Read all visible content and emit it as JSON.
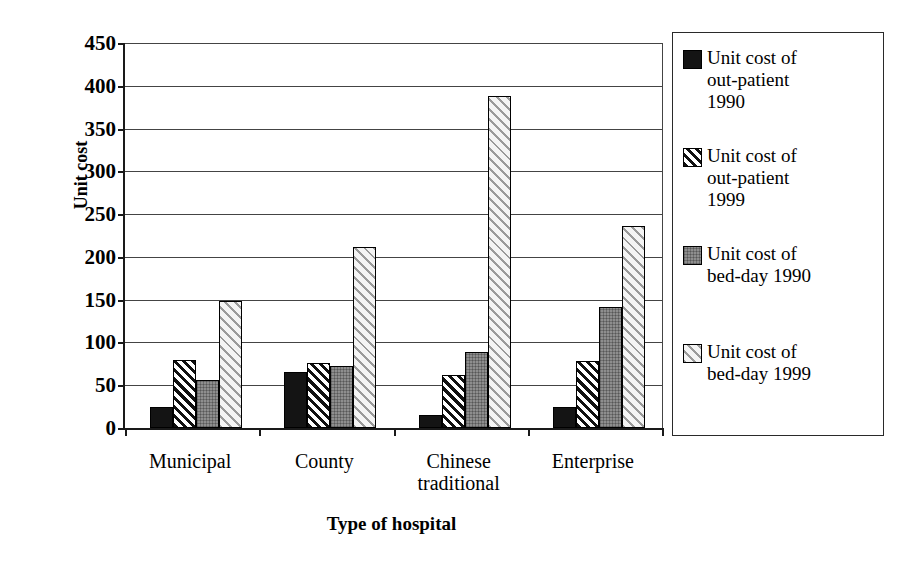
{
  "chart_data": {
    "type": "bar",
    "title": "",
    "subtitle": "",
    "xlabel": "Type of hospital",
    "ylabel": "Unit cost",
    "categories": [
      "Municipal",
      "County",
      "Chinese traditional",
      "Enterprise"
    ],
    "category_lines": [
      [
        "Municipal"
      ],
      [
        "County"
      ],
      [
        "Chinese",
        "traditional"
      ],
      [
        "Enterprise"
      ]
    ],
    "series": [
      {
        "name": "Unit cost of out-patient 1990",
        "name_lines": [
          "Unit cost of",
          "out-patient",
          "1990"
        ],
        "pattern": "solid-black",
        "values": [
          25,
          65,
          15,
          25
        ]
      },
      {
        "name": "Unit cost of out-patient 1999",
        "name_lines": [
          "Unit cost of",
          "out-patient",
          "1999"
        ],
        "pattern": "dark-hatch",
        "values": [
          80,
          76,
          62,
          78
        ]
      },
      {
        "name": "Unit cost of bed-day 1990",
        "name_lines": [
          "Unit cost of",
          "bed-day 1990"
        ],
        "pattern": "gray-dots",
        "values": [
          56,
          72,
          89,
          141
        ]
      },
      {
        "name": "Unit cost of bed-day 1999",
        "name_lines": [
          "Unit cost of",
          "bed-day 1999"
        ],
        "pattern": "light-hatch",
        "values": [
          148,
          212,
          388,
          236
        ]
      }
    ],
    "ylim": [
      0,
      450
    ],
    "ytick_step": 50,
    "ytick_labels": [
      "450",
      "400",
      "350",
      "300",
      "250",
      "200",
      "150",
      "100",
      "50",
      "0"
    ],
    "ytick_values": [
      450,
      400,
      350,
      300,
      250,
      200,
      150,
      100,
      50,
      0
    ],
    "grid": true,
    "grid_axis": "y",
    "legend_position": "right"
  },
  "axis": {
    "y_title": "Unit cost",
    "x_title": "Type of hospital"
  },
  "colors": {
    "axis": "#1a1a1a",
    "gridline": "#444444",
    "bar_outline": "#000000",
    "series_1": "#141414",
    "series_2": "#111111",
    "series_3": "#8e8e8e",
    "series_4": "#9a9a9a",
    "background": "#ffffff"
  }
}
